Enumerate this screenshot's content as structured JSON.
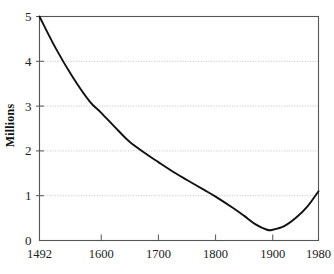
{
  "figure": {
    "background_color": "#ffffff",
    "frame_color": "#555555",
    "curve_color": "#111111",
    "grid_color": "#bbbbbb",
    "title_partial": "",
    "ylabel": "Millions"
  },
  "axes": {
    "x_ticks": [
      "1492",
      "1600",
      "1700",
      "1800",
      "1900",
      "1980"
    ],
    "y_ticks": [
      "5",
      "4",
      "3",
      "2",
      "1",
      "0"
    ]
  },
  "chart_data": {
    "type": "line",
    "title": "",
    "xlabel": "",
    "ylabel": "Millions",
    "xlim": [
      1492,
      1980
    ],
    "ylim": [
      0,
      5
    ],
    "grid": true,
    "grid_axis": "y",
    "legend": false,
    "series": [
      {
        "name": "Population",
        "x": [
          1492,
          1520,
          1550,
          1580,
          1600,
          1630,
          1650,
          1680,
          1700,
          1730,
          1750,
          1780,
          1800,
          1830,
          1850,
          1870,
          1890,
          1900,
          1920,
          1940,
          1960,
          1980
        ],
        "values": [
          5.0,
          4.3,
          3.65,
          3.1,
          2.85,
          2.45,
          2.2,
          1.92,
          1.75,
          1.5,
          1.35,
          1.13,
          0.98,
          0.73,
          0.55,
          0.36,
          0.24,
          0.24,
          0.32,
          0.5,
          0.75,
          1.1
        ]
      }
    ],
    "x_tick_values": [
      1492,
      1600,
      1700,
      1800,
      1900,
      1980
    ],
    "y_tick_values": [
      0,
      1,
      2,
      3,
      4,
      5
    ],
    "annotations": []
  }
}
